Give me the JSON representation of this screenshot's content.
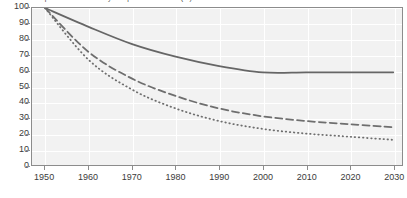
{
  "chart_data": {
    "type": "line",
    "title": "Per capita water availability compared with 1950 (%)",
    "xlabel": "",
    "ylabel": "",
    "x": [
      1950,
      1960,
      1970,
      1980,
      1990,
      2000,
      2010,
      2020,
      2030
    ],
    "categories": [
      "1950",
      "1960",
      "1970",
      "1980",
      "1990",
      "2000",
      "2010",
      "2020",
      "2030"
    ],
    "xlim": [
      1947,
      2032
    ],
    "ylim": [
      0,
      100
    ],
    "ytick_values": [
      0,
      10,
      20,
      30,
      40,
      50,
      60,
      70,
      80,
      90,
      100
    ],
    "ytick_labels": [
      "0",
      "10",
      "20",
      "30",
      "40",
      "50",
      "60",
      "70",
      "80",
      "90",
      "100"
    ],
    "grid": true,
    "legend": "none",
    "series": [
      {
        "name": "solid-series",
        "style": "solid",
        "color": "#666666",
        "values": [
          100,
          88,
          77,
          69,
          63,
          59,
          59,
          59,
          59
        ]
      },
      {
        "name": "dashed-series",
        "style": "dashed",
        "color": "#6e6e6e",
        "values": [
          100,
          72,
          55,
          44,
          36,
          31,
          28,
          26,
          24
        ]
      },
      {
        "name": "dotted-series",
        "style": "dotted",
        "color": "#6e6e6e",
        "values": [
          100,
          67,
          48,
          36,
          28,
          23,
          20,
          18,
          16
        ]
      }
    ]
  },
  "colors": {
    "plot_background": "#f2f2f2",
    "page_background": "#ffffff",
    "frame": "#8c8c8c",
    "grid": "#ffffff",
    "text": "#3b3b3b"
  }
}
